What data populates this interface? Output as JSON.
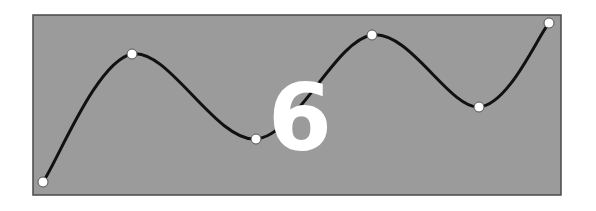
{
  "figure": {
    "label": "6",
    "panel": {
      "x": 33,
      "y": 15,
      "width": 528,
      "height": 180,
      "fill": "#9b9b9b",
      "stroke": "#4a4a4a"
    },
    "curve": {
      "stroke": "#111111",
      "width": 3
    },
    "control_points": [
      {
        "x": 43,
        "y": 182
      },
      {
        "x": 132,
        "y": 54
      },
      {
        "x": 256,
        "y": 139
      },
      {
        "x": 372,
        "y": 35
      },
      {
        "x": 479,
        "y": 107
      },
      {
        "x": 549,
        "y": 23
      }
    ],
    "point_fill": "#ffffff",
    "label_color": "#ffffff"
  }
}
